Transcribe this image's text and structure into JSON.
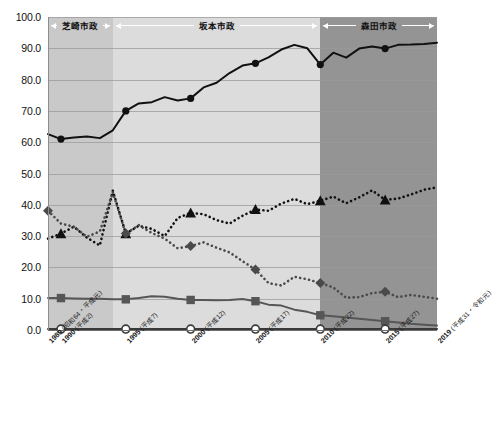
{
  "chart_data": {
    "type": "line",
    "title": "",
    "xlabel": "",
    "ylabel": "",
    "ylim": [
      0.0,
      100.0
    ],
    "ytick_labels": [
      "100.0",
      "90.0",
      "80.0",
      "70.0",
      "60.0",
      "50.0",
      "40.0",
      "30.0",
      "20.0",
      "10.0",
      "0.0"
    ],
    "ytick_values": [
      100,
      90,
      80,
      70,
      60,
      50,
      40,
      30,
      20,
      10,
      0
    ],
    "grid": true,
    "legend": "none",
    "xlim": [
      1989,
      2019
    ],
    "x": [
      1989,
      1990,
      1991,
      1992,
      1993,
      1994,
      1995,
      1996,
      1997,
      1998,
      1999,
      2000,
      2001,
      2002,
      2003,
      2004,
      2005,
      2006,
      2007,
      2008,
      2009,
      2010,
      2011,
      2012,
      2013,
      2014,
      2015,
      2016,
      2017,
      2018,
      2019
    ],
    "xtick_labels": [
      {
        "year": "1989",
        "era": "(昭和64・平成元)"
      },
      {
        "year": "1990",
        "era": "(平成2)"
      },
      {
        "year": "1995",
        "era": "(平成7)"
      },
      {
        "year": "2000",
        "era": "(平成12)"
      },
      {
        "year": "2005",
        "era": "(平成17)"
      },
      {
        "year": "2010",
        "era": "(平成22)"
      },
      {
        "year": "2015",
        "era": "(平成27)"
      },
      {
        "year": "2019",
        "era": "(平成31・令和元)"
      }
    ],
    "series": [
      {
        "name": "solid-line-circle",
        "marker": "circle-filled",
        "style": "solid",
        "color": "#111111",
        "marker_years": [
          1990,
          1995,
          2000,
          2005,
          2010,
          2015
        ],
        "values": [
          62.6,
          61.0,
          61.5,
          61.8,
          61.3,
          63.8,
          70.0,
          72.4,
          72.8,
          74.4,
          73.3,
          74.0,
          77.5,
          79.0,
          82.1,
          84.5,
          85.2,
          87.1,
          89.6,
          91.1,
          90.0,
          84.8,
          88.6,
          87.0,
          89.9,
          90.6,
          89.9,
          91.1,
          91.2,
          91.4,
          91.8
        ]
      },
      {
        "name": "dotted-line-triangle",
        "marker": "triangle-filled",
        "style": "dotted",
        "color": "#111111",
        "marker_years": [
          1990,
          1995,
          2000,
          2005,
          2010,
          2015
        ],
        "values": [
          29.2,
          30.8,
          33.0,
          29.5,
          27.0,
          44.5,
          30.8,
          33.3,
          32.3,
          30.0,
          35.8,
          37.4,
          37.0,
          35.1,
          34.0,
          36.5,
          38.5,
          38.1,
          40.4,
          41.9,
          40.2,
          41.3,
          42.6,
          40.5,
          42.4,
          44.6,
          41.6,
          42.0,
          43.3,
          44.8,
          45.6
        ]
      },
      {
        "name": "dotted-line-diamond",
        "marker": "diamond-filled",
        "style": "dotted",
        "color": "#4a4a4a",
        "marker_years": [
          1989,
          1995,
          2000,
          2005,
          2010,
          2015
        ],
        "values": [
          38.1,
          34.0,
          33.0,
          29.8,
          31.5,
          44.0,
          30.8,
          33.5,
          31.0,
          29.2,
          26.1,
          26.8,
          28.0,
          26.3,
          24.8,
          22.0,
          19.3,
          15.0,
          14.2,
          17.0,
          16.2,
          15.0,
          13.6,
          10.3,
          10.5,
          11.8,
          12.2,
          10.5,
          11.2,
          10.6,
          10.0
        ]
      },
      {
        "name": "solid-line-square",
        "marker": "square-filled",
        "style": "solid",
        "color": "#565656",
        "marker_years": [
          1990,
          1995,
          2000,
          2005,
          2010,
          2015
        ],
        "values": [
          10.2,
          10.2,
          10.1,
          10.0,
          10.0,
          9.8,
          9.8,
          10.2,
          10.8,
          10.6,
          10.0,
          9.6,
          9.6,
          9.5,
          9.6,
          9.9,
          9.2,
          8.1,
          7.8,
          6.5,
          5.8,
          4.7,
          4.4,
          4.0,
          3.6,
          3.2,
          2.8,
          2.4,
          2.0,
          1.7,
          1.4
        ]
      },
      {
        "name": "solid-line-open-circle",
        "marker": "circle-open",
        "style": "solid",
        "color": "#3a3a3a",
        "marker_years": [
          1990,
          1995,
          2000,
          2005,
          2010,
          2015
        ],
        "values": [
          0.3,
          0.3,
          0.3,
          0.3,
          0.3,
          0.3,
          0.3,
          0.3,
          0.3,
          0.3,
          0.3,
          0.3,
          0.3,
          0.3,
          0.3,
          0.3,
          0.3,
          0.3,
          0.3,
          0.3,
          0.3,
          0.3,
          0.3,
          0.3,
          0.3,
          0.3,
          0.3,
          0.3,
          0.3,
          0.3,
          0.3
        ]
      }
    ],
    "bands": [
      {
        "label": "芝崎市政",
        "start": 1989,
        "end": 1994,
        "color": "#c9c9c9"
      },
      {
        "label": "坂本市政",
        "start": 1994,
        "end": 2010,
        "color": "#dcdcdc"
      },
      {
        "label": "森田市政",
        "start": 2010,
        "end": 2019,
        "color": "#949494"
      }
    ]
  }
}
